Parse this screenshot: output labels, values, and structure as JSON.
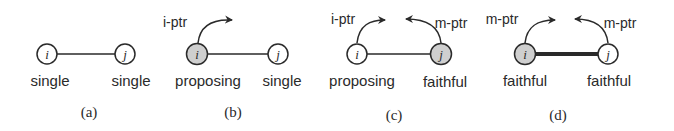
{
  "colors": {
    "stroke": "#2a2a2a",
    "node_fill": "#ffffff",
    "node_highlight_fill": "#cfcfcf",
    "background": "#ffffff"
  },
  "panels": [
    {
      "caption": "(a)",
      "nodes": [
        {
          "id": "i",
          "label": "i",
          "state": "single",
          "highlighted": false
        },
        {
          "id": "j",
          "label": "j",
          "state": "single",
          "highlighted": false
        }
      ],
      "edge": {
        "from": "i",
        "to": "j",
        "style": "thin"
      },
      "pointers": []
    },
    {
      "caption": "(b)",
      "nodes": [
        {
          "id": "i",
          "label": "i",
          "state": "proposing",
          "highlighted": true
        },
        {
          "id": "j",
          "label": "j",
          "state": "single",
          "highlighted": false
        }
      ],
      "edge": {
        "from": "i",
        "to": "j",
        "style": "thin"
      },
      "pointers": [
        {
          "label": "i-ptr",
          "from": "i",
          "direction": "right"
        }
      ]
    },
    {
      "caption": "(c)",
      "nodes": [
        {
          "id": "i",
          "label": "i",
          "state": "proposing",
          "highlighted": false
        },
        {
          "id": "j",
          "label": "j",
          "state": "faithful",
          "highlighted": true
        }
      ],
      "edge": {
        "from": "i",
        "to": "j",
        "style": "thin"
      },
      "pointers": [
        {
          "label": "i-ptr",
          "from": "i",
          "direction": "right"
        },
        {
          "label": "m-ptr",
          "from": "j",
          "direction": "left"
        }
      ]
    },
    {
      "caption": "(d)",
      "nodes": [
        {
          "id": "i",
          "label": "i",
          "state": "faithful",
          "highlighted": true
        },
        {
          "id": "j",
          "label": "j",
          "state": "faithful",
          "highlighted": false
        }
      ],
      "edge": {
        "from": "i",
        "to": "j",
        "style": "thick"
      },
      "pointers": [
        {
          "label": "m-ptr",
          "from": "i",
          "direction": "right"
        },
        {
          "label": "m-ptr",
          "from": "j",
          "direction": "left"
        }
      ]
    }
  ]
}
